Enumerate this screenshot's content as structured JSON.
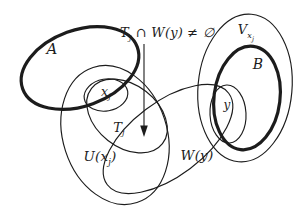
{
  "colors": {
    "ink": "#1c1c1c",
    "background": "#ffffff"
  },
  "annotation": {
    "base": "T",
    "sub": "j",
    "rest": " ∩ W(y) ≠ ∅"
  },
  "sets": {
    "A": {
      "label": "A"
    },
    "B": {
      "label": "B"
    },
    "V": {
      "base": "V",
      "sub": "x",
      "subsub": "j"
    },
    "xj": {
      "base": "x",
      "sub": "j"
    },
    "Tj": {
      "base": "T",
      "sub": "j"
    },
    "U": {
      "pre": "U(",
      "base": "x",
      "sub": "j",
      "post": ")"
    },
    "W": {
      "label": "W(y)"
    },
    "y": {
      "label": "y"
    }
  }
}
